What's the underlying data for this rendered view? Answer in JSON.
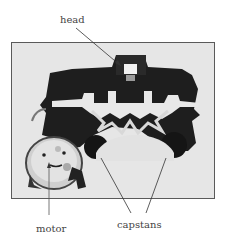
{
  "figure": {
    "labels": {
      "head": "head",
      "motor": "motor",
      "capstans": "capstans"
    }
  }
}
